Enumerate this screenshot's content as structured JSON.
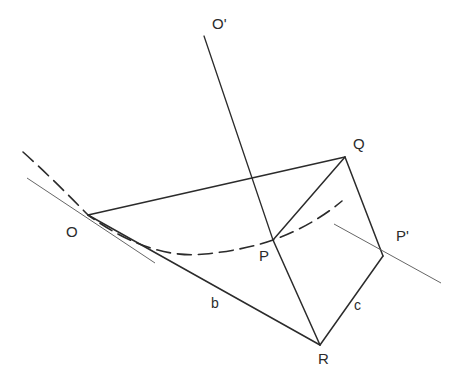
{
  "figure": {
    "background_color": "#ffffff",
    "stroke_color": "#2b2b2b",
    "thin_stroke_color": "#555555",
    "width": 456,
    "height": 384
  },
  "points": {
    "O": {
      "label": "O",
      "x": 88,
      "y": 215,
      "label_x": 66,
      "label_y": 224
    },
    "Oprime": {
      "label": "O'",
      "x": 204,
      "y": 36,
      "label_x": 212,
      "label_y": 16
    },
    "Q": {
      "label": "Q",
      "x": 345,
      "y": 157,
      "label_x": 353,
      "label_y": 136
    },
    "P": {
      "label": "P",
      "x": 273,
      "y": 240,
      "label_x": 259,
      "label_y": 248
    },
    "Pprime": {
      "label": "P'",
      "x": 383,
      "y": 256,
      "label_x": 396,
      "label_y": 228
    },
    "R": {
      "label": "R",
      "x": 320,
      "y": 345,
      "label_x": 318,
      "label_y": 351
    }
  },
  "edges": [
    {
      "name": "edge-O-Q",
      "from": "O",
      "to": "Q",
      "style": "solid",
      "width": 1.5
    },
    {
      "name": "edge-O-R",
      "from": "O",
      "to": "R",
      "style": "solid",
      "width": 1.5,
      "label": "b"
    },
    {
      "name": "edge-Oprime-P",
      "from": "Oprime",
      "to": "P",
      "style": "solid",
      "width": 1.3
    },
    {
      "name": "edge-Q-P",
      "from": "Q",
      "to": "P",
      "style": "solid",
      "width": 1.5
    },
    {
      "name": "edge-Q-Pprime",
      "from": "Q",
      "to": "Pprime",
      "style": "solid",
      "width": 1.5
    },
    {
      "name": "edge-P-R",
      "from": "P",
      "to": "R",
      "style": "solid",
      "width": 1.5
    },
    {
      "name": "edge-R-Pprime",
      "from": "R",
      "to": "Pprime",
      "style": "solid",
      "width": 1.5,
      "label": "c"
    }
  ],
  "edge_labels": {
    "b": {
      "text": "b",
      "x": 211,
      "y": 296
    },
    "c": {
      "text": "c",
      "x": 354,
      "y": 298
    }
  },
  "curves": {
    "geodesic_dashed": {
      "name": "geodesic-curve",
      "style": "dashed",
      "dash_pattern": "14 7",
      "path": "M 23 152 Q 52 178 88 215 Q 150 260 205 254 Q 245 250 273 240 Q 312 226 342 201"
    },
    "tangent_at_O": {
      "name": "tangent-line-at-O",
      "style": "thin-solid",
      "path": "M 27 178 L 155 263"
    },
    "tangent_at_Pprime": {
      "name": "tangent-line-at-Pprime",
      "style": "thin-solid",
      "path": "M 334 224 L 441 283"
    }
  }
}
